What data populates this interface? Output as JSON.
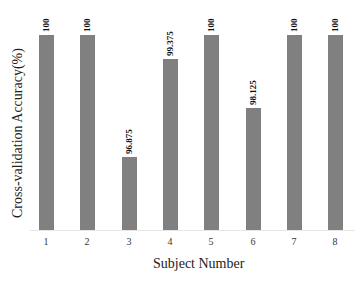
{
  "chart_data": {
    "type": "bar",
    "title": "",
    "xlabel": "Subject Number",
    "ylabel": "Cross-validation Accuracy(%)",
    "categories": [
      "1",
      "2",
      "3",
      "4",
      "5",
      "6",
      "7",
      "8"
    ],
    "values": [
      100,
      100,
      96.875,
      99.375,
      100,
      98.125,
      100,
      100
    ],
    "value_labels": [
      "100",
      "100",
      "96.875",
      "99.375",
      "100",
      "98.125",
      "100",
      "100"
    ],
    "ylim": [
      95,
      100
    ],
    "grid": false,
    "legend": null,
    "bar_color": "#808080"
  }
}
